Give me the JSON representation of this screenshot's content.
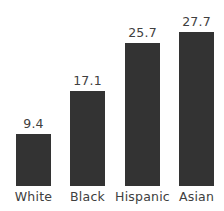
{
  "chart_data": {
    "type": "bar",
    "title": "",
    "subtitle": "",
    "xlabel": "",
    "ylabel": "",
    "categories": [
      "White",
      "Black",
      "Hispanic",
      "Asian"
    ],
    "values": [
      9.4,
      17.1,
      25.7,
      27.7
    ],
    "data_labels": [
      "9.4",
      "17.1",
      "25.7",
      "27.7"
    ],
    "ylim": [
      0,
      33.5
    ],
    "grid": false,
    "legend": false,
    "axis_lines": false,
    "tick_marks": false,
    "bar_color": "#333333",
    "text_color": "#404040",
    "background_color": "#ffffff"
  },
  "colors": {
    "bar": "#333333",
    "text": "#404040",
    "background": "#ffffff"
  }
}
